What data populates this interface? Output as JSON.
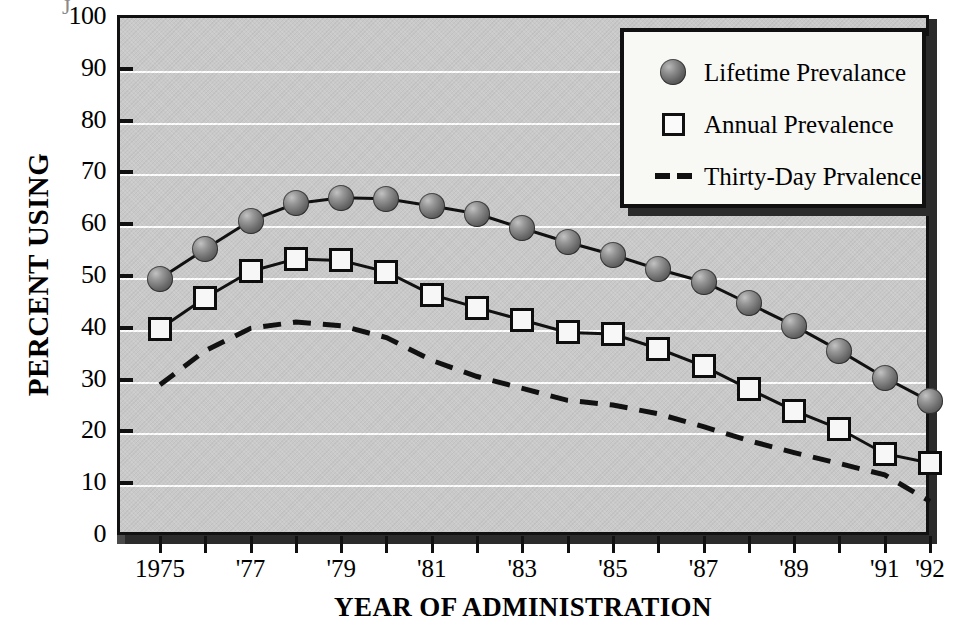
{
  "axes": {
    "y_title": "PERCENT USING",
    "x_title": "YEAR OF ADMINISTRATION",
    "y_ticks": [
      "100",
      "90",
      "80",
      "70",
      "60",
      "50",
      "40",
      "30",
      "20",
      "10",
      "0"
    ],
    "x_tick_labels": [
      "1975",
      "'77",
      "'79",
      "'81",
      "'83",
      "'85",
      "'87",
      "'89",
      "'91",
      "'92"
    ]
  },
  "legend": {
    "items": [
      {
        "label": "Lifetime Prevalance",
        "key": "sphere-marker-icon"
      },
      {
        "label": "Annual Prevalence",
        "key": "square-marker-icon"
      },
      {
        "label": "Thirty-Day Prvalence",
        "key": "dashed-line-icon"
      }
    ]
  },
  "colors": {
    "plot_background": "#c9c9c9",
    "gridline": "#fdfdfd",
    "line": "#111111",
    "frame_shadow": "#2b2b2b",
    "legend_background": "#f8f8f5",
    "sphere_marker": "#6a6a6a",
    "square_marker": "#f7f7f7"
  },
  "chart_data": {
    "type": "line",
    "title": "",
    "xlabel": "YEAR OF ADMINISTRATION",
    "ylabel": "PERCENT USING",
    "ylim": [
      0,
      100
    ],
    "xlim": [
      1975,
      1992
    ],
    "grid": true,
    "legend_position": "top-right",
    "x": [
      1975,
      1976,
      1977,
      1978,
      1979,
      1980,
      1981,
      1982,
      1983,
      1984,
      1985,
      1986,
      1987,
      1988,
      1989,
      1990,
      1991,
      1992
    ],
    "tick_years": [
      1975,
      1976,
      1977,
      1978,
      1979,
      1980,
      1981,
      1982,
      1983,
      1984,
      1985,
      1986,
      1987,
      1988,
      1989,
      1990,
      1991,
      1992
    ],
    "series": [
      {
        "name": "Lifetime Prevalance",
        "marker": "sphere",
        "style": "solid",
        "values": [
          49.5,
          55.2,
          60.7,
          64.0,
          65.1,
          64.9,
          63.5,
          62.0,
          59.2,
          56.5,
          54.1,
          51.3,
          48.9,
          44.7,
          40.4,
          35.6,
          30.4,
          25.8
        ]
      },
      {
        "name": "Annual Prevalence",
        "marker": "square",
        "style": "solid",
        "values": [
          39.8,
          45.8,
          50.9,
          53.3,
          53.0,
          50.8,
          46.4,
          43.9,
          41.5,
          39.1,
          38.8,
          36.0,
          32.6,
          28.2,
          24.0,
          20.5,
          15.7,
          13.9
        ]
      },
      {
        "name": "Thirty-Day Prvalence",
        "marker": "none",
        "style": "dashed",
        "values": [
          29.0,
          35.6,
          39.9,
          41.1,
          40.4,
          38.1,
          33.7,
          30.6,
          28.3,
          26.0,
          25.1,
          23.4,
          20.9,
          18.2,
          15.9,
          13.8,
          11.6,
          6.5
        ]
      }
    ]
  }
}
